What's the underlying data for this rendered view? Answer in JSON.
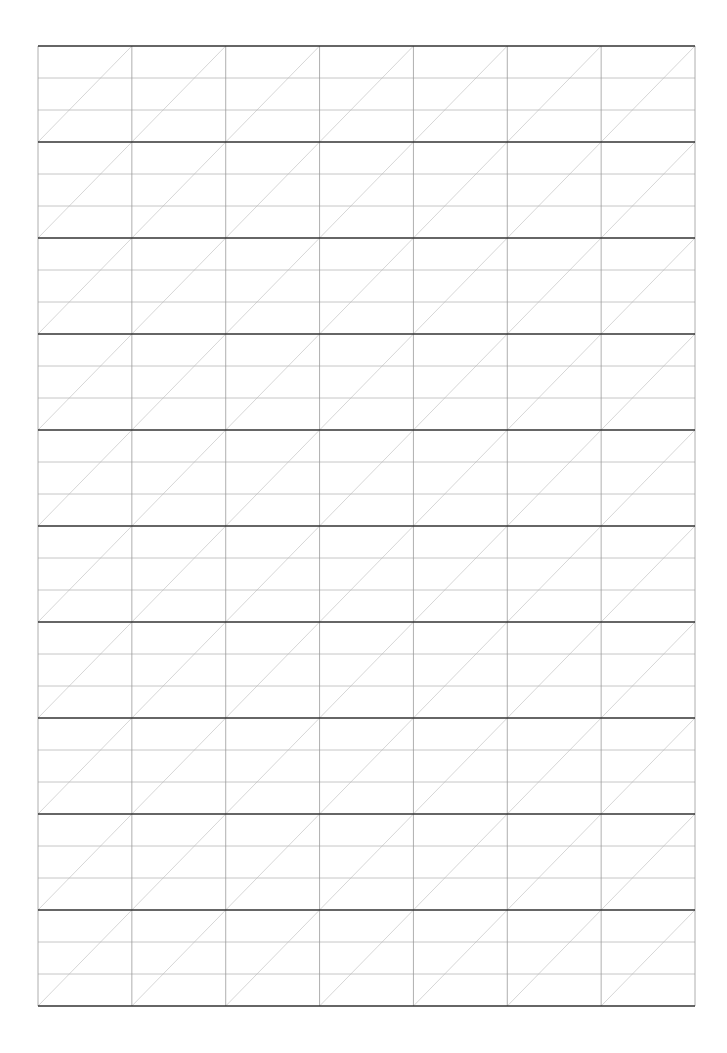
{
  "page": {
    "type": "handwriting-practice-sheet",
    "width": 727,
    "height": 1053,
    "background": "#ffffff"
  },
  "grid": {
    "left": 38,
    "top": 46,
    "right": 695,
    "bottom": 1006,
    "columns": 7,
    "rows": 10,
    "row_height": 96,
    "guide_lines_per_row": 2,
    "diagonal_direction": "bottom-left-to-top-right",
    "colors": {
      "thick_line": "#333333",
      "thin_line": "#b8b8b8",
      "vertical_line": "#9a9a9a",
      "diagonal_line": "#c4c4c4"
    },
    "stroke_widths": {
      "thick_line": 1.6,
      "thin_line": 0.8,
      "vertical_line": 0.8,
      "diagonal_line": 0.7
    }
  }
}
